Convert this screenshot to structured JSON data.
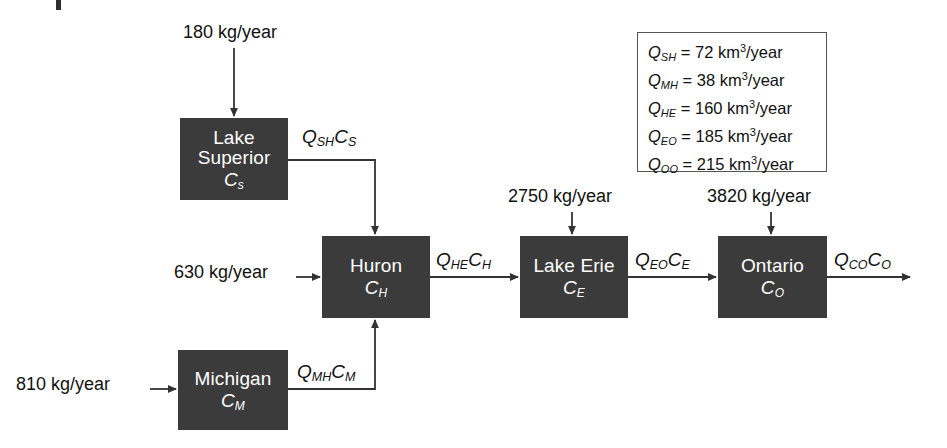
{
  "diagram": {
    "box_fill_color": "#3b3b3b",
    "box_text_color": "#ffffff",
    "line_color": "#333333",
    "legend_border_color": "#555555",
    "background_color": "#ffffff"
  },
  "lakes": [
    {
      "key": "superior",
      "name": "Lake",
      "name2": "Superior",
      "concentration": "C",
      "concentration_sub": "s"
    },
    {
      "key": "michigan",
      "name": "Michigan",
      "name2": "",
      "concentration": "C",
      "concentration_sub": "M"
    },
    {
      "key": "huron",
      "name": "Huron",
      "name2": "",
      "concentration": "C",
      "concentration_sub": "H"
    },
    {
      "key": "erie",
      "name": "Lake Erie",
      "name2": "",
      "concentration": "C",
      "concentration_sub": "E"
    },
    {
      "key": "ontario",
      "name": "Ontario",
      "name2": "",
      "concentration": "C",
      "concentration_sub": "O"
    }
  ],
  "loadings": [
    {
      "key": "superior_load",
      "text": "180 kg/year"
    },
    {
      "key": "huron_load",
      "text": "630 kg/year"
    },
    {
      "key": "michigan_load",
      "text": "810 kg/year"
    },
    {
      "key": "erie_load",
      "text": "2750 kg/year"
    },
    {
      "key": "ontario_load",
      "text": "3820 kg/year"
    }
  ],
  "fluxes": [
    {
      "key": "sh",
      "q": "Q",
      "q_sub": "SH",
      "c": "C",
      "c_sub": "S"
    },
    {
      "key": "mh",
      "q": "Q",
      "q_sub": "MH",
      "c": "C",
      "c_sub": "M"
    },
    {
      "key": "he",
      "q": "Q",
      "q_sub": "HE",
      "c": "C",
      "c_sub": "H"
    },
    {
      "key": "eo",
      "q": "Q",
      "q_sub": "EO",
      "c": "C",
      "c_sub": "E"
    },
    {
      "key": "co",
      "q": "Q",
      "q_sub": "CO",
      "c": "C",
      "c_sub": "O"
    }
  ],
  "legend": {
    "rows": [
      {
        "symbol": "Q",
        "sub": "SH",
        "eq": "=",
        "value": "72",
        "unit": "km",
        "exp": "3",
        "per": "/year"
      },
      {
        "symbol": "Q",
        "sub": "MH",
        "eq": "=",
        "value": "38",
        "unit": "km",
        "exp": "3",
        "per": "/year"
      },
      {
        "symbol": "Q",
        "sub": "HE",
        "eq": "=",
        "value": "160",
        "unit": "km",
        "exp": "3",
        "per": "/year"
      },
      {
        "symbol": "Q",
        "sub": "EO",
        "eq": "=",
        "value": "185",
        "unit": "km",
        "exp": "3",
        "per": "/year"
      },
      {
        "symbol": "Q",
        "sub": "OO",
        "eq": "=",
        "value": "215",
        "unit": "km",
        "exp": "3",
        "per": "/year"
      }
    ]
  }
}
